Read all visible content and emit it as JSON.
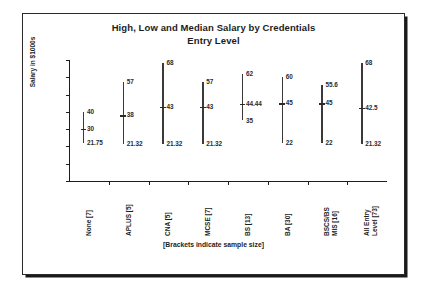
{
  "chart_data": {
    "type": "bar",
    "title": "High, Low and Median Salary by Credentials",
    "subtitle": "Entry Level",
    "title_lines": [
      "High, Low and Median Salary by Credentials",
      "Entry Level"
    ],
    "xlabel": "[Brackets indicate sample size]",
    "ylabel": "Salary in $1000s",
    "ylim": [
      0,
      70
    ],
    "yticks": [
      70,
      60,
      50,
      40,
      30,
      20,
      10,
      0
    ],
    "ytick_labels": [
      "70",
      "60",
      "50",
      "40",
      "30",
      "20",
      "10",
      "0"
    ],
    "grid": false,
    "legend": false,
    "categories": [
      "None [7]",
      "APLUS [5]",
      "CNA [5]",
      "MCSE [7]",
      "BS [13]",
      "BA [30]",
      "BSCS/BS MIS [16]",
      "All Entry Level [73]"
    ],
    "category_label_lines": [
      [
        "None [7]"
      ],
      [
        "APLUS [5]"
      ],
      [
        "CNA [5]"
      ],
      [
        "MCSE [7]"
      ],
      [
        "BS [13]"
      ],
      [
        "BA [30]"
      ],
      [
        "BSCS/BS",
        "MIS [16]"
      ],
      [
        "All Entry",
        "Level [73]"
      ]
    ],
    "sample_sizes": [
      7,
      5,
      5,
      7,
      13,
      30,
      16,
      73
    ],
    "series": [
      {
        "name": "High",
        "values": [
          40,
          57,
          68,
          57,
          62,
          60,
          55.6,
          68
        ]
      },
      {
        "name": "Median",
        "values": [
          30,
          38,
          43,
          43,
          44.44,
          45,
          45,
          42.5
        ]
      },
      {
        "name": "Low",
        "values": [
          21.75,
          21.32,
          21.32,
          21.32,
          35,
          22,
          22,
          21.32
        ]
      }
    ],
    "point_labels": {
      "high": [
        "40",
        "57",
        "68",
        "57",
        "62",
        "60",
        "55.6",
        "68"
      ],
      "median": [
        "30",
        "38",
        "43",
        "43",
        "44.44",
        "45",
        "45",
        "42.5"
      ],
      "low": [
        "21.75",
        "21.32",
        "21.32",
        "21.32",
        "35",
        "22",
        "22",
        "21.32"
      ]
    },
    "colors": {
      "line": "#3a3a3a",
      "text": "#1d1d1d",
      "axis": "#1d1d1d"
    }
  }
}
